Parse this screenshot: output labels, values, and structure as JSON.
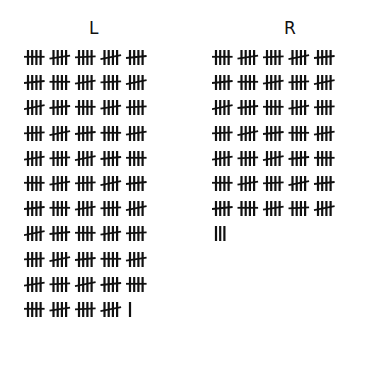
{
  "columns": [
    {
      "label": "L",
      "rows": [
        [
          5,
          5,
          5,
          5,
          5
        ],
        [
          5,
          5,
          5,
          5,
          5
        ],
        [
          5,
          5,
          5,
          5,
          5
        ],
        [
          5,
          5,
          5,
          5,
          5
        ],
        [
          5,
          5,
          5,
          5,
          5
        ],
        [
          5,
          5,
          5,
          5,
          5
        ],
        [
          5,
          5,
          5,
          5,
          5
        ],
        [
          5,
          5,
          5,
          5,
          5
        ],
        [
          5,
          5,
          5,
          5,
          5
        ],
        [
          5,
          5,
          5,
          5,
          5
        ],
        [
          5,
          5,
          5,
          5,
          1
        ]
      ],
      "total": 271
    },
    {
      "label": "R",
      "rows": [
        [
          5,
          5,
          5,
          5,
          5
        ],
        [
          5,
          5,
          5,
          5,
          5
        ],
        [
          5,
          5,
          5,
          5,
          5
        ],
        [
          5,
          5,
          5,
          5,
          5
        ],
        [
          5,
          5,
          5,
          5,
          5
        ],
        [
          5,
          5,
          5,
          5,
          5
        ],
        [
          5,
          5,
          5,
          5,
          5
        ],
        [
          3
        ]
      ],
      "total": 178
    }
  ],
  "ink_color": "#111111"
}
